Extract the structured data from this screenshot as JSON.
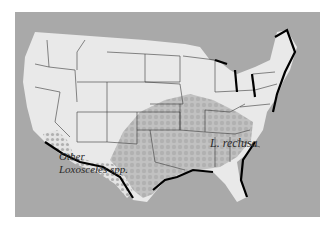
{
  "map": {
    "title": "",
    "region": "Contiguous United States",
    "colors": {
      "background": "#ffffff",
      "water": "#a9a9a9",
      "land": "#e9e9e9",
      "state_border": "#3a3a3a",
      "coastline": "#000000",
      "recluse_range": "#b5b5b5",
      "other_range": "#c9c9c9"
    },
    "labels": {
      "recluse": "L. reclusa",
      "other_line1": "Other",
      "other_line2": "Loxosceles spp."
    },
    "legend": []
  }
}
